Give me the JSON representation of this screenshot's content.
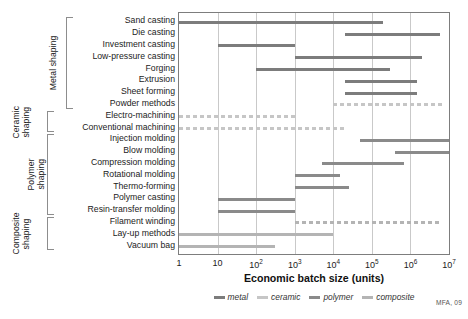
{
  "credit": "MFA, 09",
  "axis": {
    "xlabel": "Economic batch size (units)",
    "ticks": [
      "1",
      "10",
      "10²",
      "10³",
      "10⁴",
      "10⁵",
      "10⁶",
      "10⁷"
    ]
  },
  "legend": {
    "items": [
      {
        "label": "metal",
        "color": "#7c7c7c",
        "style": "solid"
      },
      {
        "label": "ceramic",
        "color": "#c6c6c6",
        "style": "dashed"
      },
      {
        "label": "polymer",
        "color": "#8a8a8a",
        "style": "solid"
      },
      {
        "label": "composite",
        "color": "#b4b4b4",
        "style": "solid"
      }
    ]
  },
  "groups": [
    {
      "name": "Metal shaping",
      "label": "Metal shaping"
    },
    {
      "name": "Ceramic shaping",
      "label": "Ceramic\nshaping"
    },
    {
      "name": "Polymer shaping",
      "label": "Polymer\nshaping"
    },
    {
      "name": "Composite shaping",
      "label": "Composite\nshaping"
    }
  ],
  "chart_data": {
    "type": "bar",
    "orientation": "horizontal",
    "title": "",
    "xlabel": "Economic batch size (units)",
    "ylabel": "",
    "xscale": "log",
    "xlim": [
      1,
      10000000
    ],
    "grid": true,
    "legend_position": "bottom",
    "categories": [
      "Sand casting",
      "Die casting",
      "Investment casting",
      "Low-pressure casting",
      "Forging",
      "Extrusion",
      "Sheet forming",
      "Powder methods",
      "Electro-machining",
      "Conventional machining",
      "Injection molding",
      "Blow molding",
      "Compression molding",
      "Rotational molding",
      "Thermo-forming",
      "Polymer casting",
      "Resin-transfer molding",
      "Filament winding",
      "Lay-up methods",
      "Vacuum bag"
    ],
    "bars": [
      {
        "category": "Sand casting",
        "group": "Metal shaping",
        "material": "metal",
        "start": 1,
        "end": 200000,
        "style": "solid"
      },
      {
        "category": "Die casting",
        "group": "Metal shaping",
        "material": "metal",
        "start": 20000,
        "end": 6000000,
        "style": "solid"
      },
      {
        "category": "Investment casting",
        "group": "Metal shaping",
        "material": "metal",
        "start": 10,
        "end": 1000,
        "style": "solid"
      },
      {
        "category": "Low-pressure casting",
        "group": "Metal shaping",
        "material": "metal",
        "start": 1000,
        "end": 2000000,
        "style": "solid"
      },
      {
        "category": "Forging",
        "group": "Metal shaping",
        "material": "metal",
        "start": 100,
        "end": 300000,
        "style": "solid"
      },
      {
        "category": "Extrusion",
        "group": "Metal shaping",
        "material": "metal",
        "start": 20000,
        "end": 1500000,
        "style": "solid"
      },
      {
        "category": "Sheet forming",
        "group": "Metal shaping",
        "material": "metal",
        "start": 20000,
        "end": 1500000,
        "style": "solid"
      },
      {
        "category": "Powder methods",
        "group": "Metal shaping",
        "material": "ceramic",
        "start": 10000,
        "end": 7000000,
        "style": "dashed"
      },
      {
        "category": "Electro-machining",
        "group": "Ceramic shaping",
        "material": "ceramic",
        "start": 1,
        "end": 1000,
        "style": "dashed"
      },
      {
        "category": "Conventional machining",
        "group": "Ceramic shaping",
        "material": "ceramic",
        "start": 1,
        "end": 20000,
        "style": "dashed"
      },
      {
        "category": "Injection molding",
        "group": "Polymer shaping",
        "material": "polymer",
        "start": 50000,
        "end": 10000000,
        "style": "solid"
      },
      {
        "category": "Blow molding",
        "group": "Polymer shaping",
        "material": "polymer",
        "start": 400000,
        "end": 10000000,
        "style": "solid"
      },
      {
        "category": "Compression molding",
        "group": "Polymer shaping",
        "material": "polymer",
        "start": 5000,
        "end": 700000,
        "style": "solid"
      },
      {
        "category": "Rotational molding",
        "group": "Polymer shaping",
        "material": "polymer",
        "start": 1000,
        "end": 15000,
        "style": "solid"
      },
      {
        "category": "Thermo-forming",
        "group": "Polymer shaping",
        "material": "polymer",
        "start": 1000,
        "end": 25000,
        "style": "solid"
      },
      {
        "category": "Polymer casting",
        "group": "Polymer shaping",
        "material": "polymer",
        "start": 10,
        "end": 1000,
        "style": "solid"
      },
      {
        "category": "Resin-transfer molding",
        "group": "Polymer shaping",
        "material": "polymer",
        "start": 10,
        "end": 1000,
        "style": "solid"
      },
      {
        "category": "Filament winding",
        "group": "Composite shaping",
        "material": "composite",
        "start": 1000,
        "end": 6000000,
        "style": "dashed"
      },
      {
        "category": "Lay-up methods",
        "group": "Composite shaping",
        "material": "composite",
        "start": 1,
        "end": 10000,
        "style": "solid"
      },
      {
        "category": "Vacuum bag",
        "group": "Composite shaping",
        "material": "composite",
        "start": 1,
        "end": 300,
        "style": "solid"
      }
    ]
  }
}
